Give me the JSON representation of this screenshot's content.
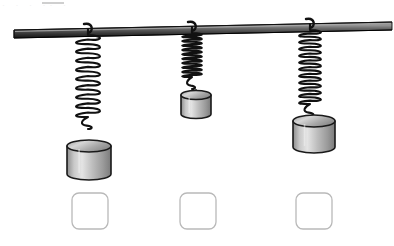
{
  "page": {
    "kind": "physics-worksheet-figure",
    "width": 394,
    "height": 246,
    "background_color": "#ffffff",
    "artifact_text": "· ·  ·   ·· ·"
  },
  "support_rod": {
    "name": "horizontal support rod",
    "color_light": "#8c8c8c",
    "color_mid": "#5a5a5a",
    "color_dark": "#1c1c1c",
    "outline_color": "#111111",
    "left_x": 14,
    "right_x": 392,
    "left_y": 30,
    "right_y": 22,
    "thickness": 8
  },
  "springs": [
    {
      "id": 1,
      "label": "",
      "anchor_x": 88,
      "anchor_y": 27,
      "coil_count": 9,
      "coil_radius": 11,
      "length": 100,
      "wire_color": "#111111",
      "wire_width": 2.1,
      "stretch_description": "longest / most stretched"
    },
    {
      "id": 2,
      "label": "",
      "anchor_x": 192,
      "anchor_y": 25,
      "coil_count": 10,
      "coil_radius": 9,
      "length": 62,
      "wire_color": "#111111",
      "wire_width": 2.1,
      "stretch_description": "shortest / least stretched"
    },
    {
      "id": 3,
      "label": "",
      "anchor_x": 310,
      "anchor_y": 22,
      "coil_count": 11,
      "coil_radius": 10,
      "length": 92,
      "wire_color": "#111111",
      "wire_width": 2.1,
      "stretch_description": "medium stretch"
    }
  ],
  "masses": [
    {
      "id": 1,
      "label": "",
      "center_x": 89,
      "top_y": 146,
      "width": 44,
      "body_height": 28,
      "ellipse_ry": 6,
      "size_description": "large",
      "face_light": "#e8e8e8",
      "face_mid": "#b4b4b4",
      "face_dark": "#777777",
      "top_light": "#d8d8d8",
      "top_dark": "#8f8f8f",
      "outline_color": "#1a1a1a"
    },
    {
      "id": 2,
      "label": "",
      "center_x": 196,
      "top_y": 95,
      "width": 30,
      "body_height": 19,
      "ellipse_ry": 4.5,
      "size_description": "small",
      "face_light": "#e8e8e8",
      "face_mid": "#b4b4b4",
      "face_dark": "#777777",
      "top_light": "#d8d8d8",
      "top_dark": "#8f8f8f",
      "outline_color": "#1a1a1a"
    },
    {
      "id": 3,
      "label": "",
      "center_x": 314,
      "top_y": 121,
      "width": 42,
      "body_height": 26,
      "ellipse_ry": 6,
      "size_description": "large",
      "face_light": "#e8e8e8",
      "face_mid": "#b4b4b4",
      "face_dark": "#777777",
      "top_light": "#d8d8d8",
      "top_dark": "#8f8f8f",
      "outline_color": "#1a1a1a"
    }
  ],
  "answer_boxes": [
    {
      "id": 1,
      "value": "",
      "placeholder": "",
      "x": 72,
      "y": 193,
      "size": 36,
      "radius": 7,
      "border_color": "#b9b9b9",
      "fill": "#ffffff"
    },
    {
      "id": 2,
      "value": "",
      "placeholder": "",
      "x": 180,
      "y": 193,
      "size": 36,
      "radius": 7,
      "border_color": "#b9b9b9",
      "fill": "#ffffff"
    },
    {
      "id": 3,
      "value": "",
      "placeholder": "",
      "x": 296,
      "y": 193,
      "size": 36,
      "radius": 7,
      "border_color": "#b9b9b9",
      "fill": "#ffffff"
    }
  ]
}
